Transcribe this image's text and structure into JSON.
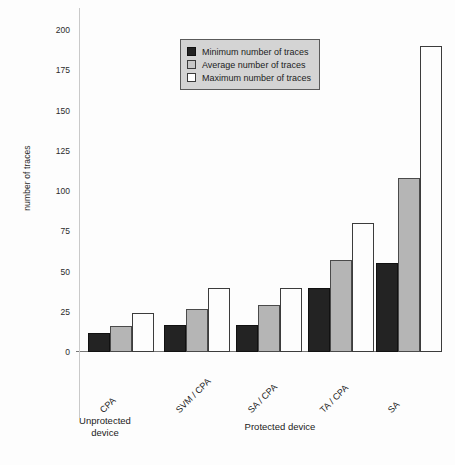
{
  "chart_data": {
    "type": "bar",
    "title": "",
    "xlabel": "",
    "ylabel": "number of traces",
    "ylim": [
      0,
      200
    ],
    "yticks": [
      0,
      25,
      50,
      75,
      100,
      125,
      150,
      175,
      200
    ],
    "grid": false,
    "legend_position": "top-center",
    "categories": [
      "CPA",
      "SVM / CPA",
      "SA / CPA",
      "TA / CPA",
      "SA"
    ],
    "groups": [
      {
        "name": "Unprotected device",
        "categories": [
          "CPA"
        ]
      },
      {
        "name": "Protected device",
        "categories": [
          "SVM / CPA",
          "SA / CPA",
          "TA / CPA",
          "SA"
        ]
      }
    ],
    "series": [
      {
        "name": "Minimum number of traces",
        "color": "#232323",
        "values": [
          12,
          17,
          17,
          40,
          55
        ]
      },
      {
        "name": "Average number of traces",
        "color": "#b5b5b5",
        "values": [
          16,
          27,
          29,
          57,
          108
        ]
      },
      {
        "name": "Maximum number of traces",
        "color": "#ffffff",
        "values": [
          24,
          40,
          40,
          80,
          190
        ]
      }
    ]
  },
  "axis": {
    "y_title": "number of traces",
    "ticks": [
      "200",
      "175",
      "150",
      "125",
      "100",
      "75",
      "50",
      "25",
      "0"
    ]
  },
  "legend": {
    "items": [
      {
        "label": "Minimum number of traces",
        "swatch": "min"
      },
      {
        "label": "Average number of traces",
        "swatch": "avg"
      },
      {
        "label": "Maximum number of traces",
        "swatch": "max"
      }
    ]
  },
  "categories": {
    "labels": [
      "CPA",
      "SVM / CPA",
      "SA / CPA",
      "TA / CPA",
      "SA"
    ]
  },
  "groups": {
    "unprotected": "Unprotected\ndevice",
    "protected": "Protected device"
  }
}
